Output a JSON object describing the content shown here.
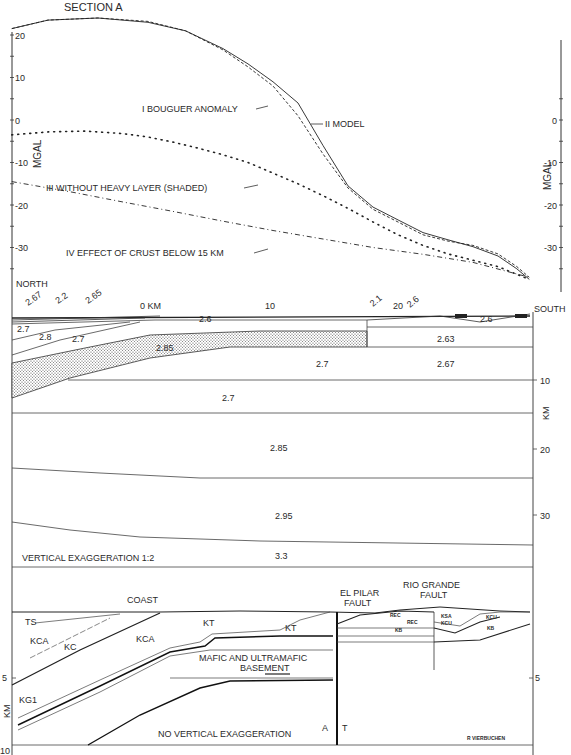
{
  "figure": {
    "section_title": "SECTION A",
    "author_credit": "R VIERBUCHEN"
  },
  "chart_data": {
    "type": "line",
    "title": "SECTION A",
    "xlabel": "KM",
    "ylabel": "MGAL",
    "x_range_km": [
      -10.9,
      30.5
    ],
    "ylim": [
      -38,
      24
    ],
    "left_y_ticks": [
      "20",
      "10",
      "0",
      "-10",
      "-20",
      "-30"
    ],
    "right_y_ticks": [
      "0",
      "-10",
      "-20",
      "-30"
    ],
    "x_tick_labels": [
      "0 KM",
      "10",
      "20"
    ],
    "x_ticks": [
      0,
      10,
      20
    ],
    "direction_labels": {
      "left": "NORTH",
      "right": "SOUTH"
    },
    "series": [
      {
        "name": "I BOUGUER ANOMALY",
        "style": "dashed",
        "x": [
          -10.9,
          -8,
          -4,
          0,
          3,
          6,
          8,
          10,
          12,
          14,
          16,
          18,
          20,
          22,
          24,
          26,
          28,
          29.5,
          30.5
        ],
        "y": [
          21.5,
          23.5,
          24.0,
          23.2,
          21.0,
          16.5,
          12.5,
          8.0,
          1.0,
          -8.0,
          -16.0,
          -21.0,
          -24.0,
          -27.0,
          -28.5,
          -29.5,
          -31.5,
          -34.5,
          -37.0
        ]
      },
      {
        "name": "II MODEL",
        "style": "solid",
        "x": [
          -10.9,
          -8,
          -4,
          0,
          3,
          6,
          8,
          10,
          12,
          14,
          16,
          18,
          20,
          22,
          24,
          26,
          28,
          29.5,
          30.5
        ],
        "y": [
          21.5,
          23.5,
          24.0,
          23.0,
          21.0,
          16.8,
          13.2,
          9.0,
          4.0,
          -6.0,
          -15.5,
          -20.5,
          -23.5,
          -26.5,
          -28.2,
          -29.8,
          -32.0,
          -35.0,
          -37.5
        ]
      },
      {
        "name": "III WITHOUT HEAVY LAYER (SHADED)",
        "style": "dotted",
        "x": [
          -10.9,
          -8,
          -5,
          -2,
          0,
          2,
          4,
          6,
          8,
          10,
          12,
          14,
          16,
          18,
          20,
          22,
          24,
          26,
          28,
          30.5
        ],
        "y": [
          -3.5,
          -2.8,
          -2.6,
          -3.2,
          -4.0,
          -5.2,
          -6.6,
          -8.2,
          -10.0,
          -12.5,
          -15.0,
          -17.8,
          -20.8,
          -24.0,
          -27.0,
          -29.5,
          -31.5,
          -33.0,
          -34.5,
          -37.5
        ]
      },
      {
        "name": "IV EFFECT OF CRUST BELOW 15 KM",
        "style": "dash-dot",
        "x": [
          -10.9,
          -6,
          -2,
          2,
          6,
          10,
          14,
          18,
          22,
          26,
          30.5
        ],
        "y": [
          -14.5,
          -17.0,
          -19.3,
          -21.5,
          -23.8,
          -26.0,
          -28.0,
          -30.0,
          -31.6,
          -33.5,
          -37.0
        ]
      }
    ]
  },
  "crustal_section": {
    "surface_labels": [
      "2.67",
      "2.2",
      "2.65",
      "2.1",
      "2.6"
    ],
    "depth_axis_label": "KM",
    "depth_ticks": [
      "10",
      "20",
      "30"
    ],
    "density_labels": [
      "2.7",
      "2.8",
      "2.7",
      "2.6",
      "2.85",
      "2.63",
      "2.7",
      "2.67",
      "2.7",
      "2.6",
      "2.85",
      "2.95",
      "3.3"
    ],
    "shaded_layer_density": "2.85",
    "exaggeration_note": "VERTICAL EXAGGERATION 1:2"
  },
  "geologic_section": {
    "labels": {
      "coast": "COAST",
      "el_pilar_1": "EL PILAR",
      "el_pilar_2": "FAULT",
      "rio_grande_1": "RIO GRANDE",
      "rio_grande_2": "FAULT",
      "ts": "TS",
      "kca_1": "KCA",
      "kc": "KC",
      "kca_2": "KCA",
      "kt_1": "KT",
      "kt_2": "KT",
      "kg1": "KG1",
      "mafic_1": "MAFIC AND ULTRAMAFIC",
      "mafic_2": "BASEMENT",
      "fault_a": "A",
      "fault_t": "T",
      "rec_1": "REC",
      "rec_2": "REC",
      "kb_1": "KB",
      "kb_2": "KB",
      "kcu_1": "KCU",
      "kcu_2": "KCU",
      "ksa": "KSA"
    },
    "depth_axis_label": "KM",
    "depth_ticks_left": [
      "5",
      "10"
    ],
    "depth_ticks_right": [
      "5"
    ],
    "exaggeration_note": "NO VERTICAL EXAGGERATION"
  }
}
